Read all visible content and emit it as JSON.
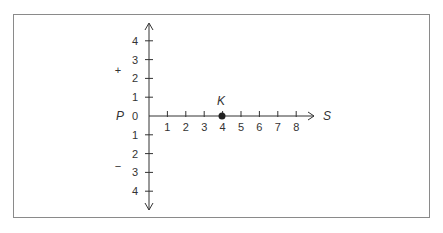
{
  "diagram": {
    "type": "number-line-axes",
    "origin_label": "0",
    "y_axis": {
      "name": "P",
      "positive_sign": "+",
      "negative_sign": "−",
      "positive_ticks": [
        "1",
        "2",
        "3",
        "4"
      ],
      "negative_ticks": [
        "1",
        "2",
        "3",
        "4"
      ]
    },
    "x_axis": {
      "name": "S",
      "ticks": [
        "1",
        "2",
        "3",
        "4",
        "5",
        "6",
        "7",
        "8"
      ]
    },
    "point": {
      "label": "K",
      "x": 4,
      "y": 0
    },
    "colors": {
      "ink": "#333333",
      "border": "#8a8a8a",
      "background": "#ffffff"
    }
  }
}
